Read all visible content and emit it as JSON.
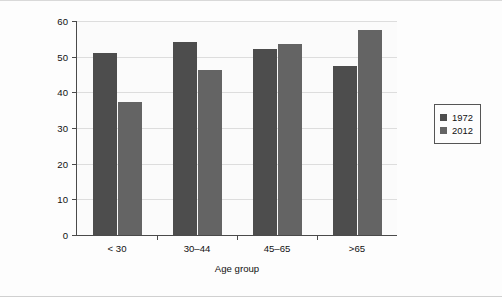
{
  "chart_data": {
    "type": "bar",
    "title": "",
    "xlabel": "Age group",
    "ylabel_lines": [
      "Average % correct on",
      "political knowledge questions"
    ],
    "categories": [
      "< 30",
      "30–44",
      "45–65",
      ">65"
    ],
    "series": [
      {
        "name": "1972",
        "color": "#4d4d4d",
        "values": [
          51,
          54.2,
          52.2,
          47.5
        ]
      },
      {
        "name": "2012",
        "color": "#646464",
        "values": [
          37.2,
          46.2,
          53.5,
          57.5
        ]
      }
    ],
    "ylim": [
      0,
      60
    ],
    "yticks": [
      0,
      10,
      20,
      30,
      40,
      50,
      60
    ],
    "ytick_labels": [
      "0",
      "10",
      "20",
      "30",
      "40",
      "50",
      "60"
    ],
    "grid": "horizontal",
    "legend_position": "right"
  }
}
